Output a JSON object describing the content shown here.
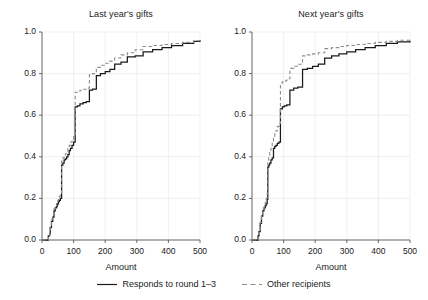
{
  "figure": {
    "xlabel": "Amount",
    "panels": [
      {
        "title": "Last year's gifts"
      },
      {
        "title": "Next year's gifts"
      }
    ]
  },
  "legend": {
    "entries": [
      {
        "label": "Responds to round 1–3",
        "style": "solid",
        "color": "#1a1a1a"
      },
      {
        "label": "Other recipients",
        "style": "dashed",
        "color": "#8c8c8c"
      }
    ]
  },
  "axes": {
    "ytick_labels": [
      "1.0",
      "0.8",
      "0.6",
      "0.4",
      "0.2",
      "0.0"
    ],
    "xtick_labels": [
      "0",
      "100",
      "200",
      "300",
      "400",
      "500"
    ]
  },
  "chart_data": {
    "type": "line",
    "title": "",
    "xlabel": "Amount",
    "ylabel": "",
    "xlim": [
      0,
      500
    ],
    "ylim": [
      0,
      1.0
    ],
    "xticks": [
      0,
      100,
      200,
      300,
      400,
      500
    ],
    "yticks": [
      0.0,
      0.2,
      0.4,
      0.6,
      0.8,
      1.0
    ],
    "grid": true,
    "legend_position": "bottom",
    "panels": [
      {
        "title": "Last year's gifts",
        "series": [
          {
            "name": "Responds to round 1–3",
            "style": "solid",
            "color": "#1a1a1a",
            "x": [
              0,
              18,
              20,
              24,
              26,
              30,
              34,
              38,
              42,
              46,
              48,
              50,
              52,
              55,
              58,
              62,
              66,
              70,
              74,
              78,
              82,
              86,
              90,
              95,
              100,
              105,
              112,
              120,
              130,
              140,
              150,
              160,
              172,
              185,
              200,
              215,
              230,
              250,
              270,
              295,
              320,
              350,
              380,
              410,
              445,
              480,
              500
            ],
            "y": [
              0.0,
              0.0,
              0.02,
              0.03,
              0.06,
              0.09,
              0.11,
              0.14,
              0.155,
              0.16,
              0.17,
              0.175,
              0.185,
              0.19,
              0.2,
              0.36,
              0.37,
              0.385,
              0.39,
              0.4,
              0.41,
              0.43,
              0.44,
              0.455,
              0.47,
              0.64,
              0.645,
              0.655,
              0.66,
              0.665,
              0.72,
              0.725,
              0.79,
              0.8,
              0.81,
              0.82,
              0.845,
              0.855,
              0.88,
              0.885,
              0.905,
              0.915,
              0.925,
              0.935,
              0.945,
              0.955,
              0.96
            ]
          },
          {
            "name": "Other recipients",
            "style": "dashed",
            "color": "#8c8c8c",
            "x": [
              0,
              18,
              20,
              24,
              26,
              30,
              34,
              38,
              42,
              46,
              48,
              50,
              52,
              55,
              58,
              62,
              66,
              70,
              74,
              78,
              82,
              86,
              90,
              95,
              100,
              105,
              112,
              120,
              130,
              140,
              150,
              160,
              172,
              185,
              200,
              215,
              230,
              250,
              270,
              295,
              320,
              350,
              380,
              410,
              445,
              480,
              500
            ],
            "y": [
              0.0,
              0.0,
              0.02,
              0.035,
              0.065,
              0.1,
              0.12,
              0.15,
              0.165,
              0.175,
              0.185,
              0.19,
              0.2,
              0.21,
              0.225,
              0.38,
              0.395,
              0.405,
              0.415,
              0.425,
              0.44,
              0.455,
              0.47,
              0.485,
              0.5,
              0.71,
              0.715,
              0.72,
              0.725,
              0.73,
              0.795,
              0.8,
              0.83,
              0.84,
              0.85,
              0.86,
              0.875,
              0.89,
              0.9,
              0.915,
              0.93,
              0.935,
              0.94,
              0.945,
              0.95,
              0.958,
              0.962
            ]
          }
        ]
      },
      {
        "title": "Next year's gifts",
        "series": [
          {
            "name": "Responds to round 1–3",
            "style": "solid",
            "color": "#1a1a1a",
            "x": [
              0,
              16,
              19,
              22,
              26,
              30,
              34,
              38,
              42,
              45,
              48,
              50,
              53,
              56,
              60,
              64,
              68,
              72,
              76,
              80,
              85,
              90,
              96,
              102,
              110,
              120,
              132,
              145,
              160,
              175,
              192,
              210,
              230,
              252,
              275,
              300,
              328,
              358,
              390,
              425,
              460,
              500
            ],
            "y": [
              0.0,
              0.0,
              0.02,
              0.04,
              0.08,
              0.115,
              0.14,
              0.155,
              0.165,
              0.175,
              0.195,
              0.35,
              0.36,
              0.37,
              0.385,
              0.395,
              0.44,
              0.45,
              0.455,
              0.465,
              0.47,
              0.63,
              0.64,
              0.645,
              0.65,
              0.72,
              0.73,
              0.735,
              0.82,
              0.825,
              0.835,
              0.845,
              0.875,
              0.885,
              0.895,
              0.905,
              0.915,
              0.925,
              0.935,
              0.945,
              0.952,
              0.958
            ]
          },
          {
            "name": "Other recipients",
            "style": "dashed",
            "color": "#8c8c8c",
            "x": [
              0,
              16,
              19,
              22,
              26,
              30,
              34,
              38,
              42,
              45,
              48,
              50,
              53,
              56,
              60,
              64,
              68,
              72,
              76,
              80,
              85,
              90,
              96,
              102,
              110,
              120,
              132,
              145,
              160,
              175,
              192,
              210,
              230,
              252,
              275,
              300,
              328,
              358,
              390,
              425,
              460,
              500
            ],
            "y": [
              0.0,
              0.0,
              0.02,
              0.045,
              0.085,
              0.125,
              0.15,
              0.17,
              0.185,
              0.2,
              0.225,
              0.38,
              0.4,
              0.42,
              0.445,
              0.465,
              0.49,
              0.51,
              0.525,
              0.545,
              0.56,
              0.755,
              0.76,
              0.765,
              0.775,
              0.825,
              0.835,
              0.845,
              0.885,
              0.89,
              0.895,
              0.9,
              0.92,
              0.925,
              0.93,
              0.935,
              0.94,
              0.945,
              0.95,
              0.955,
              0.96,
              0.968
            ]
          }
        ]
      }
    ]
  }
}
